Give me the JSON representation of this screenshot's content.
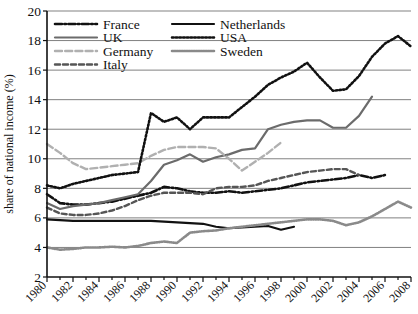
{
  "chart_data": {
    "type": "line",
    "title": "",
    "xlabel": "",
    "ylabel": "share of national income (%)",
    "ylim": [
      2,
      20
    ],
    "xlim": [
      1980,
      2008
    ],
    "yticks": [
      2,
      4,
      6,
      8,
      10,
      12,
      14,
      16,
      18,
      20
    ],
    "xticks": [
      1980,
      1982,
      1984,
      1986,
      1988,
      1990,
      1992,
      1994,
      1996,
      1998,
      2000,
      2002,
      2004,
      2006,
      2008
    ],
    "grid": "horizontal",
    "legend_position": "top-left-inside",
    "series": [
      {
        "name": "France",
        "style": "dash-dot",
        "color": "#111111",
        "x": [
          1980,
          1981,
          1982,
          1983,
          1984,
          1985,
          1986,
          1987,
          1988,
          1989,
          1990,
          1991,
          1992,
          1993,
          1994,
          1995,
          1996,
          1997,
          1998,
          1999,
          2000,
          2001,
          2002,
          2003,
          2004,
          2005,
          2006
        ],
        "values": [
          7.6,
          7.0,
          6.9,
          6.9,
          7.0,
          7.1,
          7.3,
          7.5,
          7.7,
          8.1,
          8.0,
          7.8,
          7.7,
          7.7,
          7.8,
          7.7,
          7.8,
          7.9,
          8.0,
          8.2,
          8.4,
          8.5,
          8.6,
          8.7,
          8.9,
          8.7,
          8.9
        ]
      },
      {
        "name": "UK",
        "style": "solid",
        "color": "#6b6b6b",
        "x": [
          1980,
          1981,
          1982,
          1983,
          1984,
          1985,
          1986,
          1987,
          1988,
          1989,
          1990,
          1991,
          1992,
          1993,
          1994,
          1995,
          1996,
          1997,
          1998,
          1999,
          2000,
          2001,
          2002,
          2003,
          2004,
          2005
        ],
        "values": [
          7.0,
          6.6,
          6.8,
          6.9,
          7.0,
          7.2,
          7.4,
          7.6,
          8.5,
          9.6,
          9.9,
          10.3,
          9.8,
          10.1,
          10.3,
          10.6,
          10.7,
          12.0,
          12.3,
          12.5,
          12.6,
          12.6,
          12.1,
          12.1,
          12.9,
          14.2
        ]
      },
      {
        "name": "Germany",
        "style": "long-dash",
        "color": "#b0b0b0",
        "x": [
          1980,
          1981,
          1982,
          1983,
          1984,
          1985,
          1986,
          1987,
          1988,
          1989,
          1990,
          1991,
          1992,
          1993,
          1994,
          1995,
          1996,
          1997,
          1998
        ],
        "values": [
          11.0,
          10.4,
          9.7,
          9.3,
          9.4,
          9.5,
          9.6,
          9.7,
          10.2,
          10.6,
          10.8,
          10.8,
          10.8,
          10.7,
          10.0,
          9.2,
          9.8,
          10.4,
          11.1
        ]
      },
      {
        "name": "Italy",
        "style": "dashed",
        "color": "#555555",
        "x": [
          1980,
          1981,
          1982,
          1983,
          1984,
          1985,
          1986,
          1987,
          1988,
          1989,
          1990,
          1991,
          1992,
          1993,
          1994,
          1995,
          1996,
          1997,
          1998,
          1999,
          2000,
          2001,
          2002,
          2003,
          2004
        ],
        "values": [
          6.7,
          6.3,
          6.2,
          6.2,
          6.3,
          6.5,
          6.8,
          7.2,
          7.5,
          7.7,
          7.7,
          7.7,
          7.6,
          8.0,
          8.1,
          8.1,
          8.2,
          8.5,
          8.7,
          8.9,
          9.1,
          9.2,
          9.3,
          9.3,
          8.9
        ]
      },
      {
        "name": "Netherlands",
        "style": "solid",
        "color": "#111111",
        "x": [
          1980,
          1981,
          1982,
          1983,
          1984,
          1985,
          1986,
          1987,
          1988,
          1989,
          1990,
          1991,
          1992,
          1993,
          1994,
          1995,
          1996,
          1997,
          1998,
          1999
        ],
        "values": [
          5.9,
          5.85,
          5.8,
          5.8,
          5.8,
          5.8,
          5.8,
          5.8,
          5.8,
          5.75,
          5.7,
          5.65,
          5.6,
          5.4,
          5.3,
          5.35,
          5.4,
          5.45,
          5.2,
          5.4
        ]
      },
      {
        "name": "USA",
        "style": "dotted",
        "color": "#111111",
        "x": [
          1980,
          1981,
          1982,
          1983,
          1984,
          1985,
          1986,
          1987,
          1988,
          1989,
          1990,
          1991,
          1992,
          1993,
          1994,
          1995,
          1996,
          1997,
          1998,
          1999,
          2000,
          2001,
          2002,
          2003,
          2004,
          2005,
          2006,
          2007,
          2008
        ],
        "values": [
          8.2,
          8.0,
          8.3,
          8.5,
          8.7,
          8.9,
          9.0,
          9.1,
          13.1,
          12.5,
          12.8,
          12.0,
          12.8,
          12.8,
          12.8,
          13.5,
          14.2,
          15.0,
          15.5,
          15.9,
          16.5,
          15.5,
          14.6,
          14.7,
          15.6,
          16.9,
          17.8,
          18.3,
          17.6
        ]
      },
      {
        "name": "Sweden",
        "style": "dense-dot",
        "color": "#8a8a8a",
        "x": [
          1980,
          1981,
          1982,
          1983,
          1984,
          1985,
          1986,
          1987,
          1988,
          1989,
          1990,
          1991,
          1992,
          1993,
          1994,
          1995,
          1996,
          1997,
          1998,
          1999,
          2000,
          2001,
          2002,
          2003,
          2004,
          2005,
          2006,
          2007,
          2008
        ],
        "values": [
          4.0,
          3.85,
          3.9,
          4.0,
          4.0,
          4.05,
          4.0,
          4.1,
          4.3,
          4.4,
          4.3,
          5.0,
          5.1,
          5.15,
          5.3,
          5.4,
          5.5,
          5.6,
          5.7,
          5.8,
          5.9,
          5.9,
          5.8,
          5.5,
          5.7,
          6.1,
          6.6,
          7.1,
          6.7
        ]
      }
    ],
    "legend": [
      {
        "label": "France",
        "style": "dash-dot",
        "color": "#111111"
      },
      {
        "label": "Netherlands",
        "style": "solid",
        "color": "#111111"
      },
      {
        "label": "UK",
        "style": "solid",
        "color": "#6b6b6b"
      },
      {
        "label": "USA",
        "style": "dotted",
        "color": "#111111"
      },
      {
        "label": "Germany",
        "style": "long-dash",
        "color": "#b0b0b0"
      },
      {
        "label": "Sweden",
        "style": "dense-dot",
        "color": "#8a8a8a"
      },
      {
        "label": "Italy",
        "style": "dashed",
        "color": "#555555"
      }
    ]
  },
  "axis": {
    "y_title": "share of national income (%)",
    "y_tick_labels": [
      "20",
      "18",
      "16",
      "14",
      "12",
      "10",
      "8",
      "6",
      "4",
      "2"
    ],
    "x_tick_labels": [
      "1980",
      "1982",
      "1984",
      "1986",
      "1988",
      "1990",
      "1992",
      "1994",
      "1996",
      "1998",
      "2000",
      "2002",
      "2004",
      "2006",
      "2008"
    ]
  },
  "legend_labels": {
    "france": "France",
    "uk": "UK",
    "germany": "Germany",
    "italy": "Italy",
    "netherlands": "Netherlands",
    "usa": "USA",
    "sweden": "Sweden"
  }
}
